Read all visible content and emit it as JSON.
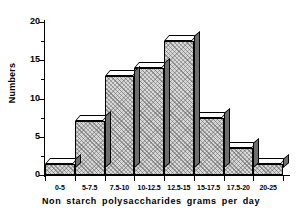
{
  "chart_data": {
    "type": "bar",
    "title": "",
    "xlabel": "Non starch polysaccharides grams per day",
    "ylabel": "Numbers",
    "categories": [
      "0-5",
      "5-7.5",
      "7.5-10",
      "10-12.5",
      "12.5-15",
      "15-17.5",
      "17.5-20",
      "20-25"
    ],
    "values": [
      1.5,
      7,
      13,
      14,
      17.5,
      7.5,
      3.5,
      1.5
    ],
    "ylim": [
      0,
      20
    ],
    "yticks_major": [
      0,
      5,
      10,
      15,
      20
    ],
    "yticks_minor": [
      2.5,
      7.5,
      12.5,
      17.5
    ],
    "grid": false,
    "legend": null,
    "style": {
      "bar_fill": "#d8d8d8",
      "bar_top_face": "#ffffff",
      "bar_side_face": "#6e6e6e",
      "outline": "#000000",
      "background": "#ffffff"
    }
  },
  "axis": {
    "y_tick_labels": [
      "0",
      "5",
      "10",
      "15",
      "20"
    ],
    "x_tick_labels": [
      "0-5",
      "5-7.5",
      "7.5-10",
      "10-12.5",
      "12.5-15",
      "15-17.5",
      "17.5-20",
      "20-25"
    ]
  }
}
